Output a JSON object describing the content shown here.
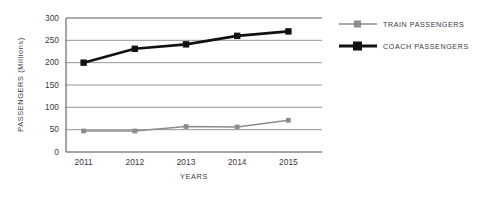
{
  "chart_data": {
    "type": "line",
    "title": "",
    "xlabel": "YEARS",
    "ylabel": "PASSENGERS (Millions)",
    "categories": [
      "2011",
      "2012",
      "2013",
      "2014",
      "2015"
    ],
    "ylim": [
      0,
      300
    ],
    "yticks": [
      "0",
      "50",
      "100",
      "150",
      "200",
      "250",
      "300"
    ],
    "grid": true,
    "legend_position": "right",
    "series": [
      {
        "name": "TRAIN PASSENGERS",
        "color": "#8c8c8c",
        "values": [
          47,
          47,
          57,
          56,
          71
        ]
      },
      {
        "name": "COACH PASSENGERS",
        "color": "#111111",
        "values": [
          200,
          231,
          241,
          260,
          270
        ]
      }
    ]
  }
}
